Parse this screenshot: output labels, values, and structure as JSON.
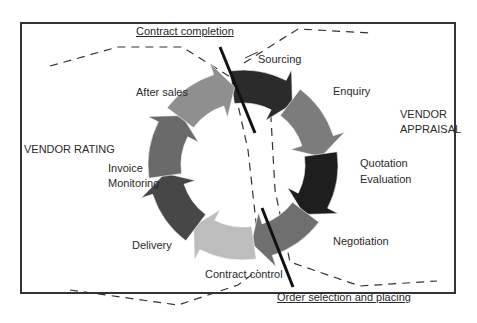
{
  "diagram": {
    "title_top": "Contract completion",
    "title_bottom": "Order selection and placing",
    "side_left": "VENDOR RATING",
    "side_right_1": "VENDOR",
    "side_right_2": "APPRAISAL",
    "stages": [
      {
        "label": "Sourcing",
        "color": "#2b2b2b"
      },
      {
        "label": "Enquiry",
        "color": "#7c7c7c"
      },
      {
        "label": "Quotation",
        "label2": "Evaluation",
        "color": "#1e1e1e"
      },
      {
        "label": "Negotiation",
        "color": "#6f6f6f"
      },
      {
        "label": "Contract control",
        "color": "#bdbdbd"
      },
      {
        "label": "Delivery",
        "color": "#474747"
      },
      {
        "label": "Invoice",
        "label2": "Monitoring",
        "color": "#6a6a6a"
      },
      {
        "label": "After sales",
        "color": "#8f8f8f"
      }
    ]
  }
}
